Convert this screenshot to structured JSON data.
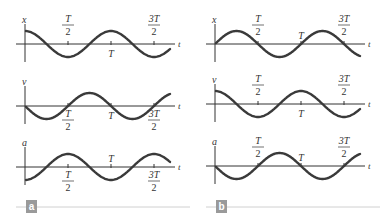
{
  "figure": {
    "panels": [
      {
        "id": "a",
        "badge_label": "a",
        "graphs": [
          {
            "y_label": "x",
            "t_label": "t",
            "function": "cos",
            "ticks": [
              {
                "top": "T",
                "bottom": "2",
                "position": "above"
              },
              {
                "text": "T",
                "position": "below"
              },
              {
                "top": "3T",
                "bottom": "2",
                "position": "above"
              }
            ]
          },
          {
            "y_label": "v",
            "t_label": "t",
            "function": "-sin",
            "ticks": [
              {
                "top": "T",
                "bottom": "2",
                "position": "below"
              },
              {
                "text": "T",
                "position": "below"
              },
              {
                "top": "3T",
                "bottom": "2",
                "position": "below"
              }
            ]
          },
          {
            "y_label": "a",
            "t_label": "t",
            "function": "-cos",
            "ticks": [
              {
                "top": "T",
                "bottom": "2",
                "position": "below"
              },
              {
                "text": "T",
                "position": "above"
              },
              {
                "top": "3T",
                "bottom": "2",
                "position": "below"
              }
            ]
          }
        ]
      },
      {
        "id": "b",
        "badge_label": "b",
        "graphs": [
          {
            "y_label": "x",
            "t_label": "t",
            "function": "sin",
            "ticks": [
              {
                "top": "T",
                "bottom": "2",
                "position": "above"
              },
              {
                "text": "T",
                "position": "above"
              },
              {
                "top": "3T",
                "bottom": "2",
                "position": "above"
              }
            ]
          },
          {
            "y_label": "v",
            "t_label": "t",
            "function": "cos",
            "ticks": [
              {
                "top": "T",
                "bottom": "2",
                "position": "above"
              },
              {
                "text": "T",
                "position": "below"
              },
              {
                "top": "3T",
                "bottom": "2",
                "position": "above"
              }
            ]
          },
          {
            "y_label": "a",
            "t_label": "t",
            "function": "-sin",
            "ticks": [
              {
                "top": "T",
                "bottom": "2",
                "position": "above"
              },
              {
                "text": "T",
                "position": "above"
              },
              {
                "top": "3T",
                "bottom": "2",
                "position": "above"
              }
            ]
          }
        ]
      }
    ],
    "colors": {
      "curve": "#3a3a3a",
      "axis": "#333333",
      "badge_bg": "#9a9a9a",
      "rule": "#d0d0d0"
    }
  }
}
